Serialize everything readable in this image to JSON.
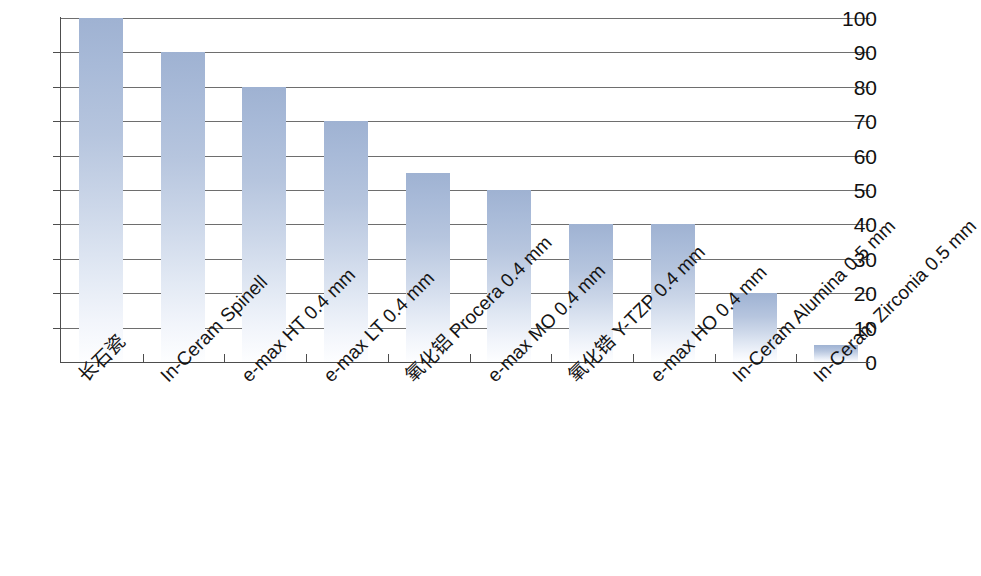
{
  "chart_data": {
    "type": "bar",
    "title": "",
    "subtitle": "",
    "xlabel": "",
    "ylabel": "",
    "categories": [
      "长石瓷",
      "In-Ceram Spinell",
      "e-max HT 0.4 mm",
      "e-max LT 0.4 mm",
      "氧化铝 Procera 0.4 mm",
      "e-max MO 0.4 mm",
      "氧化锆 Y-TZP 0.4 mm",
      "e-max HO 0.4 mm",
      "In-Ceram Alumina 0.5 mm",
      "In-Ceram Zirconia 0.5 mm"
    ],
    "values": [
      100,
      90,
      80,
      70,
      55,
      50,
      40,
      40,
      20,
      5
    ],
    "ylim": [
      0,
      100
    ],
    "ytick_labels": [
      "0",
      "10",
      "20",
      "30",
      "40",
      "50",
      "60",
      "70",
      "80",
      "90",
      "100"
    ],
    "ytick_values": [
      0,
      10,
      20,
      30,
      40,
      50,
      60,
      70,
      80,
      90,
      100
    ],
    "grid": true,
    "grid_axis": "y",
    "legend": null,
    "legend_position": "none",
    "bar_label_rotation": -45,
    "colors": {
      "bar_top": "#9fb2d2",
      "bar_mid": "#c3cfe5",
      "bar_bottom": "#fdfeff",
      "axis": "#4d4d4d",
      "gridline": "#6e6e6e",
      "text": "#151515",
      "background": "#ffffff"
    }
  }
}
